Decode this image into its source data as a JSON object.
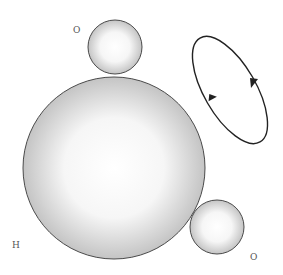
{
  "diagram": {
    "type": "molecular orbital / atom diagram",
    "labels": {
      "top_atom": "O",
      "big_atom": "H",
      "bottom_atom": "O"
    },
    "circles": [
      {
        "name": "top-small-sphere",
        "cx": 115,
        "cy": 47,
        "r": 27
      },
      {
        "name": "large-sphere",
        "cx": 114,
        "cy": 168,
        "r": 91
      },
      {
        "name": "bottom-small-sphere",
        "cx": 217,
        "cy": 227,
        "r": 27
      }
    ],
    "rotation_ellipse": {
      "cx": 230,
      "cy": 90,
      "rx": 26,
      "ry": 60,
      "angle": -30,
      "direction": "clockwise"
    },
    "colors": {
      "stroke": "#4a4a4a",
      "fill_center": "#ffffff",
      "fill_edge": "#c8c8c8",
      "arrow": "#222222"
    }
  }
}
